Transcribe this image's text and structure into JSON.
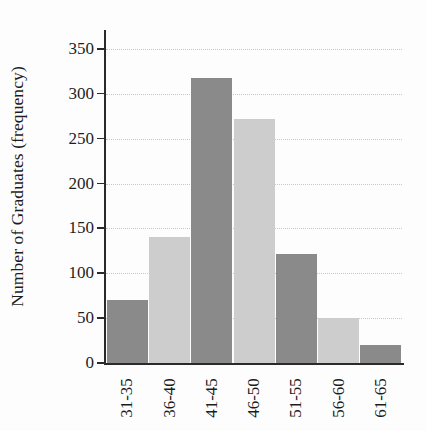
{
  "chart_data": {
    "type": "bar",
    "title": "",
    "subtitle": "",
    "xlabel": "",
    "ylabel": "Number of Graduates (frequency)",
    "categories": [
      "31-35",
      "36-40",
      "41-45",
      "46-50",
      "51-55",
      "56-60",
      "61-65"
    ],
    "values": [
      70,
      140,
      318,
      272,
      122,
      50,
      20
    ],
    "ytick_labels": [
      "0",
      "50",
      "100",
      "150",
      "200",
      "250",
      "300",
      "350"
    ],
    "yticks": [
      0,
      50,
      100,
      150,
      200,
      250,
      300,
      350
    ],
    "ylim": [
      0,
      350
    ],
    "grid": "horizontal-dotted",
    "legend": "none",
    "bar_colors": [
      "#8a8a8a",
      "#cdcdcd",
      "#8a8a8a",
      "#cdcdcd",
      "#8a8a8a",
      "#cdcdcd",
      "#8a8a8a"
    ],
    "colors": {
      "bar_dark": "#8a8a8a",
      "bar_light": "#cdcdcd",
      "axis": "#2a2a2a",
      "grid": "#c9c9c9",
      "text": "#1d1d1d",
      "background": "#fdfdfd"
    }
  }
}
